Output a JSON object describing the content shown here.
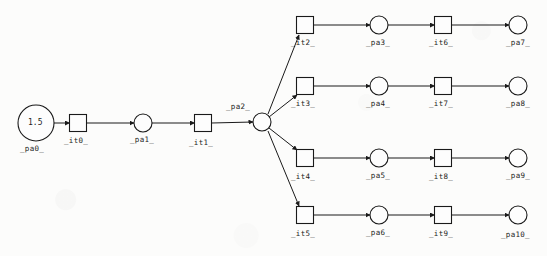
{
  "diagram": {
    "type": "petri-net",
    "background_color": "#fcfcfb",
    "stroke_color": "#1a1a1a",
    "places": [
      {
        "id": "pa0",
        "label": "_pa0_",
        "cx": 36,
        "cy": 123,
        "r": 18,
        "token": "1.5",
        "label_x": 20,
        "label_y": 145
      },
      {
        "id": "pa1",
        "label": "_pa1_",
        "cx": 143,
        "cy": 123,
        "r": 9,
        "token": "",
        "label_x": 130,
        "label_y": 136
      },
      {
        "id": "pa2",
        "label": "_pa2_",
        "cx": 262,
        "cy": 122,
        "r": 9,
        "token": "",
        "label_x": 226,
        "label_y": 103
      },
      {
        "id": "pa3",
        "label": "_pa3_",
        "cx": 379,
        "cy": 25,
        "r": 9,
        "token": "",
        "label_x": 366,
        "label_y": 39
      },
      {
        "id": "pa4",
        "label": "_pa4_",
        "cx": 379,
        "cy": 86,
        "r": 9,
        "token": "",
        "label_x": 366,
        "label_y": 100
      },
      {
        "id": "pa5",
        "label": "_pa5_",
        "cx": 379,
        "cy": 158,
        "r": 9,
        "token": "",
        "label_x": 366,
        "label_y": 172
      },
      {
        "id": "pa6",
        "label": "_pa6_",
        "cx": 379,
        "cy": 215,
        "r": 9,
        "token": "",
        "label_x": 366,
        "label_y": 229
      },
      {
        "id": "pa7",
        "label": "_pa7_",
        "cx": 518,
        "cy": 25,
        "r": 9,
        "token": "",
        "label_x": 506,
        "label_y": 39
      },
      {
        "id": "pa8",
        "label": "_pa8_",
        "cx": 518,
        "cy": 86,
        "r": 9,
        "token": "",
        "label_x": 506,
        "label_y": 100
      },
      {
        "id": "pa9",
        "label": "_pa9_",
        "cx": 518,
        "cy": 158,
        "r": 9,
        "token": "",
        "label_x": 506,
        "label_y": 172
      },
      {
        "id": "pa10",
        "label": "_pa10_",
        "cx": 518,
        "cy": 215,
        "r": 9,
        "token": "",
        "label_x": 501,
        "label_y": 231
      }
    ],
    "transitions": [
      {
        "id": "it0",
        "label": "_it0_",
        "cx": 78,
        "cy": 123,
        "size": 17,
        "label_x": 64,
        "label_y": 137
      },
      {
        "id": "it1",
        "label": "_it1_",
        "cx": 203,
        "cy": 123,
        "size": 17,
        "label_x": 189,
        "label_y": 139
      },
      {
        "id": "it2",
        "label": "_it2_",
        "cx": 305,
        "cy": 25,
        "size": 17,
        "label_x": 291,
        "label_y": 39
      },
      {
        "id": "it3",
        "label": "_it3_",
        "cx": 305,
        "cy": 86,
        "size": 17,
        "label_x": 291,
        "label_y": 100
      },
      {
        "id": "it4",
        "label": "_it4_",
        "cx": 305,
        "cy": 158,
        "size": 17,
        "label_x": 291,
        "label_y": 173
      },
      {
        "id": "it5",
        "label": "_it5_",
        "cx": 305,
        "cy": 215,
        "size": 17,
        "label_x": 291,
        "label_y": 230
      },
      {
        "id": "it6",
        "label": "_it6_",
        "cx": 443,
        "cy": 25,
        "size": 17,
        "label_x": 429,
        "label_y": 39
      },
      {
        "id": "it7",
        "label": "_it7_",
        "cx": 443,
        "cy": 86,
        "size": 17,
        "label_x": 429,
        "label_y": 100
      },
      {
        "id": "it8",
        "label": "_it8_",
        "cx": 443,
        "cy": 158,
        "size": 17,
        "label_x": 429,
        "label_y": 173
      },
      {
        "id": "it9",
        "label": "_it9_",
        "cx": 443,
        "cy": 215,
        "size": 17,
        "label_x": 429,
        "label_y": 230
      }
    ],
    "arcs": [
      {
        "from": "pa0",
        "to": "it0",
        "x1": 54,
        "y1": 123,
        "x2": 69.5,
        "y2": 123
      },
      {
        "from": "it0",
        "to": "pa1",
        "x1": 86.5,
        "y1": 123,
        "x2": 134,
        "y2": 123
      },
      {
        "from": "pa1",
        "to": "it1",
        "x1": 152,
        "y1": 123,
        "x2": 194.5,
        "y2": 123
      },
      {
        "from": "it1",
        "to": "pa2",
        "x1": 211.5,
        "y1": 123,
        "x2": 253,
        "y2": 122
      },
      {
        "from": "pa2",
        "to": "it2",
        "x1": 268,
        "y1": 114,
        "x2": 299,
        "y2": 35
      },
      {
        "from": "pa2",
        "to": "it3",
        "x1": 269,
        "y1": 117,
        "x2": 297,
        "y2": 95
      },
      {
        "from": "pa2",
        "to": "it4",
        "x1": 269,
        "y1": 128,
        "x2": 297,
        "y2": 150
      },
      {
        "from": "pa2",
        "to": "it5",
        "x1": 268,
        "y1": 131,
        "x2": 299,
        "y2": 206
      },
      {
        "from": "it2",
        "to": "pa3",
        "x1": 313.5,
        "y1": 25,
        "x2": 370,
        "y2": 25
      },
      {
        "from": "pa3",
        "to": "it6",
        "x1": 388,
        "y1": 25,
        "x2": 434.5,
        "y2": 25
      },
      {
        "from": "it6",
        "to": "pa7",
        "x1": 451.5,
        "y1": 25,
        "x2": 509,
        "y2": 25
      },
      {
        "from": "it3",
        "to": "pa4",
        "x1": 313.5,
        "y1": 86,
        "x2": 370,
        "y2": 86
      },
      {
        "from": "pa4",
        "to": "it7",
        "x1": 388,
        "y1": 86,
        "x2": 434.5,
        "y2": 86
      },
      {
        "from": "it7",
        "to": "pa8",
        "x1": 451.5,
        "y1": 86,
        "x2": 509,
        "y2": 86
      },
      {
        "from": "it4",
        "to": "pa5",
        "x1": 313.5,
        "y1": 158,
        "x2": 370,
        "y2": 158
      },
      {
        "from": "pa5",
        "to": "it8",
        "x1": 388,
        "y1": 158,
        "x2": 434.5,
        "y2": 158
      },
      {
        "from": "it8",
        "to": "pa9",
        "x1": 451.5,
        "y1": 158,
        "x2": 509,
        "y2": 158
      },
      {
        "from": "it5",
        "to": "pa6",
        "x1": 313.5,
        "y1": 215,
        "x2": 370,
        "y2": 215
      },
      {
        "from": "pa6",
        "to": "it9",
        "x1": 388,
        "y1": 215,
        "x2": 434.5,
        "y2": 215
      },
      {
        "from": "it9",
        "to": "pa10",
        "x1": 451.5,
        "y1": 215,
        "x2": 509,
        "y2": 215
      }
    ]
  }
}
